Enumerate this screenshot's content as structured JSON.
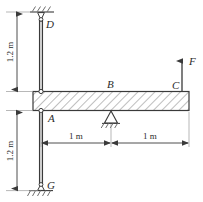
{
  "figure": {
    "type": "statics-free-body-diagram",
    "stroke_color": "#3a3a3a",
    "hatch_color": "#6e6e6e",
    "background": "#ffffff"
  },
  "labels": {
    "point_d": "D",
    "point_a": "A",
    "point_b": "B",
    "point_c": "C",
    "point_g": "G",
    "force": "F"
  },
  "dimensions": {
    "upper_column": "1.2 m",
    "lower_column": "1.2 m",
    "beam_left_span": "1 m",
    "beam_right_span": "1 m"
  },
  "supports": {
    "top": "pin-support-hatched-ground",
    "bottom": "pin-support-hatched-ground",
    "middle": "triangular-pin-support"
  },
  "load": {
    "symbol": "F",
    "direction": "up",
    "location": "C"
  }
}
